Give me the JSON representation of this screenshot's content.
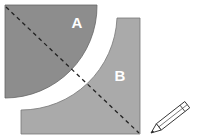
{
  "diagram": {
    "shapes": [
      {
        "id": "A",
        "label": "A",
        "type": "quarter-disc",
        "fill": "#8c8c8c"
      },
      {
        "id": "B",
        "label": "B",
        "type": "square-minus-quarter-disc",
        "fill": "#a9a9a9"
      }
    ],
    "line": {
      "style": "dashed",
      "color": "#222222"
    },
    "tool": "pencil-icon"
  }
}
